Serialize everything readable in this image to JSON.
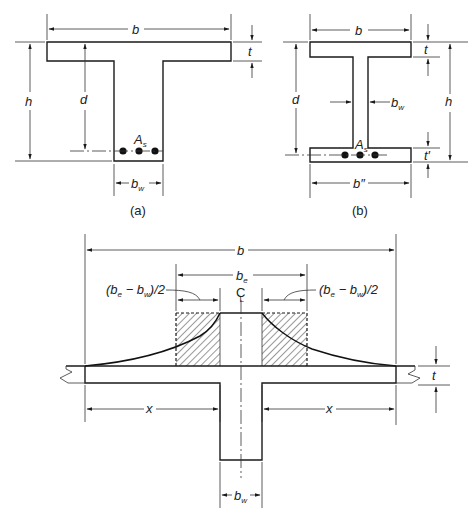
{
  "figure_a": {
    "caption": "(a)",
    "labels": {
      "flange_width": "b",
      "flange_thickness": "t",
      "total_height": "h",
      "effective_depth": "d",
      "steel_area": "A",
      "steel_area_sub": "s",
      "web_width": "b",
      "web_width_sub": "w"
    }
  },
  "figure_b": {
    "caption": "(b)",
    "labels": {
      "top_flange_width": "b",
      "top_flange_thickness": "t",
      "total_height": "h",
      "effective_depth": "d",
      "web_width": "b",
      "web_width_sub": "w",
      "steel_area": "A",
      "steel_area_sub": "s",
      "bottom_flange_thickness": "t′",
      "bottom_flange_width": "b″"
    }
  },
  "figure_c": {
    "labels": {
      "total_width": "b",
      "effective_width": "b",
      "effective_width_sub": "e",
      "overhang_left": "(b",
      "overhang_left_rest": " − b",
      "overhang_left_end": ")/2",
      "overhang_right": "(b",
      "overhang_right_rest": " − b",
      "overhang_right_end": ")/2",
      "sub_e": "e",
      "sub_w": "w",
      "centerline": "C",
      "centerline_sub": "L",
      "slab_thickness": "t",
      "clear_span_left": "x",
      "clear_span_right": "x",
      "web_width": "b",
      "web_width_sub": "w"
    }
  }
}
